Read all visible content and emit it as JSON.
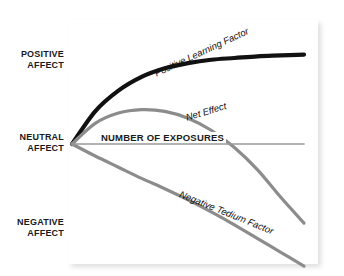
{
  "axis_labels": {
    "positive": {
      "line1": "POSITIVE",
      "line2": "AFFECT"
    },
    "neutral": {
      "line1": "NEUTRAL",
      "line2": "AFFECT"
    },
    "negative": {
      "line1": "NEGATIVE",
      "line2": "AFFECT"
    }
  },
  "curve_labels": {
    "positive_learning": "Positive Learning Factor",
    "net_effect": "Net Effect",
    "negative_tedium": "Negative Tedium Factor",
    "number_of_exposures": "NUMBER OF EXPOSURES"
  },
  "colors": {
    "positive_learning": "#111111",
    "net_effect": "#8c8c8c",
    "negative_tedium": "#8c8c8c",
    "baseline_axis": "#999999",
    "panel_background": "#ffffff",
    "page_background": "#ffffff",
    "label_text": "#1a1a1a"
  },
  "chart_data": {
    "type": "line",
    "title": "",
    "subtitle": "",
    "xlabel": "NUMBER OF EXPOSURES",
    "ylabel": "",
    "ytick_labels": [
      "POSITIVE AFFECT",
      "NEUTRAL AFFECT",
      "NEGATIVE AFFECT"
    ],
    "ytick_values": [
      1,
      0,
      -1
    ],
    "xtick_labels": [],
    "xlim": [
      0,
      10
    ],
    "ylim": [
      -1.35,
      1.35
    ],
    "grid": false,
    "legend": "inline-curve-labels",
    "baseline": 0,
    "annotations": [
      {
        "text": "NUMBER OF EXPOSURES",
        "x": 1.5,
        "y": 0.0
      },
      {
        "text": "Positive Learning Factor",
        "x": 5.0,
        "y": 0.78
      },
      {
        "text": "Net Effect",
        "x": 6.2,
        "y": 0.33
      },
      {
        "text": "Negative Tedium Factor",
        "x": 6.0,
        "y": -0.45
      }
    ],
    "x": [
      0,
      1,
      2,
      3,
      4,
      5,
      6,
      7,
      8,
      9,
      10
    ],
    "series": [
      {
        "name": "Positive Learning Factor",
        "color": "#111111",
        "style": "solid-thick",
        "values": [
          0.0,
          0.38,
          0.62,
          0.78,
          0.88,
          0.94,
          0.98,
          1.0,
          1.02,
          1.03,
          1.04
        ]
      },
      {
        "name": "Net Effect",
        "color": "#8c8c8c",
        "style": "solid",
        "values": [
          0.0,
          0.24,
          0.36,
          0.4,
          0.38,
          0.3,
          0.16,
          -0.04,
          -0.3,
          -0.62,
          -0.92
        ]
      },
      {
        "name": "Negative Tedium Factor",
        "color": "#8c8c8c",
        "style": "solid",
        "values": [
          0.0,
          -0.14,
          -0.27,
          -0.4,
          -0.52,
          -0.65,
          -0.79,
          -0.94,
          -1.1,
          -1.26,
          -1.42
        ]
      },
      {
        "name": "NUMBER OF EXPOSURES",
        "color": "#999999",
        "style": "baseline",
        "values": [
          0,
          0,
          0,
          0,
          0,
          0,
          0,
          0,
          0,
          0,
          0
        ]
      }
    ]
  }
}
